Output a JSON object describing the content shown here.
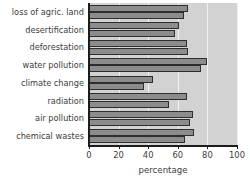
{
  "chart_data": {
    "type": "bar",
    "orientation": "horizontal",
    "title": "",
    "xlabel": "percentage",
    "ylabel": "",
    "xlim": [
      0,
      100
    ],
    "xticks": [
      0,
      20,
      40,
      60,
      80,
      100
    ],
    "grid": true,
    "grid_axis": "x",
    "legend": null,
    "categories": [
      "loss of agric. land",
      "desertification",
      "deforestation",
      "water pollution",
      "climate change",
      "radiation",
      "air pollution",
      "chemical wastes"
    ],
    "series": [
      {
        "name": "series-1",
        "values": [
          67,
          61,
          66,
          80,
          43,
          66,
          70,
          71
        ]
      },
      {
        "name": "series-2",
        "values": [
          64,
          58,
          67,
          76,
          37,
          54,
          68,
          65
        ]
      }
    ]
  },
  "style": {
    "bar_fill": "#8c8c8c",
    "bar_edge": "#2e2e2e",
    "plot_background": "#d2d2d2",
    "grid_color": "#f2f2f2",
    "text_color": "#3d3d3d",
    "axis_color": "#1c1c1c",
    "figure_background": "#ffffff"
  }
}
